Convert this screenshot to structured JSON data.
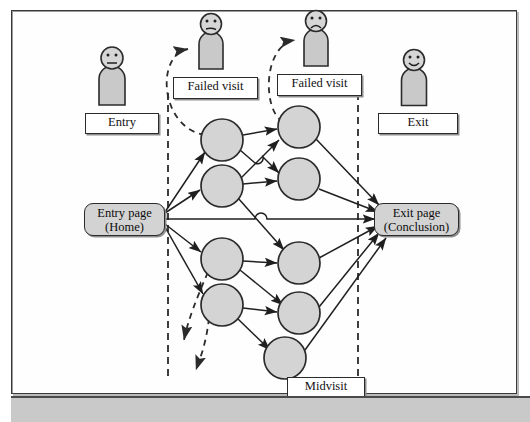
{
  "diagram": {
    "colors": {
      "node_fill": "#d4d4d4",
      "node_stroke": "#2b2b2b",
      "box_fill": "#d3d3d3",
      "label_fill": "#ffffff",
      "line": "#1f1f1f",
      "dashed": "#2b2b2b",
      "frame": "#3a3a3a",
      "band": "#c9c9c9"
    },
    "entry_page": {
      "line1": "Entry page",
      "line2": "(Home)"
    },
    "exit_page": {
      "line1": "Exit page",
      "line2": "(Conclusion)"
    },
    "labels": [
      {
        "name": "entry",
        "text": "Entry"
      },
      {
        "name": "failed-visit-1",
        "text": "Failed visit"
      },
      {
        "name": "failed-visit-2",
        "text": "Failed visit"
      },
      {
        "name": "exit",
        "text": "Exit"
      },
      {
        "name": "midvisit",
        "text": "Midvisit"
      }
    ],
    "figures": [
      {
        "name": "entry-person",
        "mood": "neutral",
        "label": "Entry"
      },
      {
        "name": "failed-visit-person-1",
        "mood": "neutral",
        "label": "Failed visit"
      },
      {
        "name": "failed-visit-person-2",
        "mood": "sad",
        "label": "Failed visit"
      },
      {
        "name": "exit-person",
        "mood": "happy",
        "label": "Exit"
      }
    ],
    "nodes": {
      "left_column": [
        {
          "id": "L1",
          "cx": 222,
          "cy": 140,
          "r": 21
        },
        {
          "id": "L2",
          "cx": 222,
          "cy": 186,
          "r": 21
        },
        {
          "id": "L3",
          "cx": 222,
          "cy": 259,
          "r": 21
        },
        {
          "id": "L4",
          "cx": 222,
          "cy": 305,
          "r": 21
        }
      ],
      "right_column": [
        {
          "id": "R1",
          "cx": 299,
          "cy": 127,
          "r": 21
        },
        {
          "id": "R2",
          "cx": 299,
          "cy": 179,
          "r": 21
        },
        {
          "id": "R3",
          "cx": 299,
          "cy": 263,
          "r": 21
        },
        {
          "id": "R4",
          "cx": 299,
          "cy": 313,
          "r": 21
        },
        {
          "id": "R5",
          "cx": 285,
          "cy": 358,
          "r": 21
        }
      ]
    },
    "boundaries": [
      {
        "name": "midvisit-start-boundary",
        "x": 168,
        "y1": 93,
        "y2": 380,
        "style": "dashed"
      },
      {
        "name": "midvisit-end-boundary",
        "x": 358,
        "y1": 93,
        "y2": 380,
        "style": "dashed"
      }
    ],
    "edge_count": 24,
    "abandon_arrow_count": 2,
    "failed_visit_arc_count": 2
  }
}
